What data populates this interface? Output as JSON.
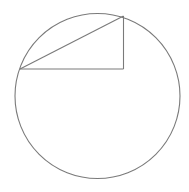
{
  "diagram": {
    "type": "geometry",
    "background": "#ffffff",
    "stroke_color": "#7a7a7a",
    "stroke_width": 1.1,
    "circle": {
      "cx": 97.5,
      "cy": 96,
      "r": 82.5
    },
    "triangle": {
      "vertices": [
        {
          "name": "left-on-circle",
          "x": 20,
          "y": 69
        },
        {
          "name": "top-on-circle",
          "x": 123.5,
          "y": 16
        },
        {
          "name": "right-angle",
          "x": 123.5,
          "y": 69
        }
      ],
      "right_angle_vertex": "right-angle"
    }
  }
}
